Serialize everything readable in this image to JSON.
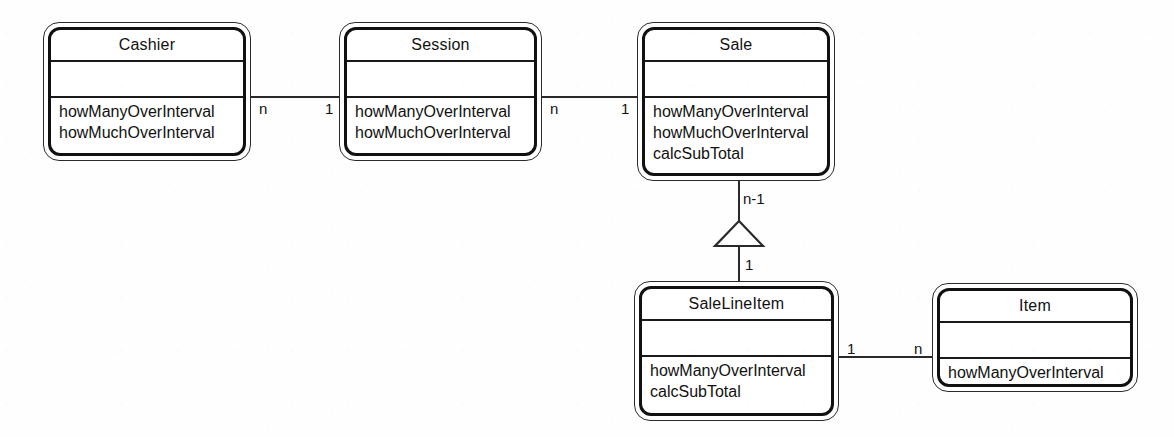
{
  "diagram": {
    "type": "uml-class-diagram",
    "title": "",
    "background_color": "#fefefe",
    "line_color": "#2a2a2a",
    "text_color": "#111111",
    "classes": [
      {
        "id": "cashier",
        "name": "Cashier",
        "attributes": [],
        "operations": [
          "howManyOverInterval",
          "howMuchOverInterval"
        ],
        "box": {
          "x": 43,
          "y": 22,
          "width": 208,
          "height": 139
        }
      },
      {
        "id": "session",
        "name": "Session",
        "attributes": [],
        "operations": [
          "howManyOverInterval",
          "howMuchOverInterval"
        ],
        "box": {
          "x": 339,
          "y": 22,
          "width": 203,
          "height": 139
        }
      },
      {
        "id": "sale",
        "name": "Sale",
        "attributes": [],
        "operations": [
          "howManyOverInterval",
          "howMuchOverInterval",
          "calcSubTotal"
        ],
        "box": {
          "x": 637,
          "y": 22,
          "width": 198,
          "height": 159
        }
      },
      {
        "id": "salelineitem",
        "name": "SaleLineItem",
        "attributes": [],
        "operations": [
          "howManyOverInterval",
          "calcSubTotal"
        ],
        "box": {
          "x": 634,
          "y": 281,
          "width": 205,
          "height": 140
        }
      },
      {
        "id": "item",
        "name": "Item",
        "attributes": [],
        "operations": [
          "howManyOverInterval"
        ],
        "box": {
          "x": 932,
          "y": 283,
          "width": 206,
          "height": 109
        }
      }
    ],
    "associations": [
      {
        "id": "cashier-session",
        "from": "cashier",
        "to": "session",
        "from_multiplicity": "n",
        "to_multiplicity": "1",
        "kind": "association"
      },
      {
        "id": "session-sale",
        "from": "session",
        "to": "sale",
        "from_multiplicity": "n",
        "to_multiplicity": "1",
        "kind": "association"
      },
      {
        "id": "sale-salelineitem",
        "from": "sale",
        "to": "salelineitem",
        "from_multiplicity": "n-1",
        "to_multiplicity": "1",
        "kind": "generalization-hollow-triangle"
      },
      {
        "id": "salelineitem-item",
        "from": "salelineitem",
        "to": "item",
        "from_multiplicity": "1",
        "to_multiplicity": "n",
        "kind": "association"
      }
    ]
  }
}
